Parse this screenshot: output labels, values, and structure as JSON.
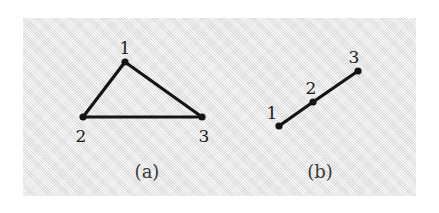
{
  "figure": {
    "background_color": "#ffffff",
    "plate_color": "#e9e9e9",
    "ink_color": "#141414",
    "subfigures": [
      {
        "id": "a",
        "caption": "(a)",
        "caption_x": 147,
        "caption_y": 163,
        "kind": "triangle-graph",
        "nodes": [
          {
            "label": "1",
            "x": 125,
            "y": 62,
            "label_x": 125,
            "label_y": 40
          },
          {
            "label": "2",
            "x": 83,
            "y": 117,
            "label_x": 81,
            "label_y": 128
          },
          {
            "label": "3",
            "x": 202,
            "y": 117,
            "label_x": 204,
            "label_y": 128
          }
        ],
        "edges": [
          {
            "from": 0,
            "to": 1
          },
          {
            "from": 0,
            "to": 2
          },
          {
            "from": 1,
            "to": 2
          }
        ]
      },
      {
        "id": "b",
        "caption": "(b)",
        "caption_x": 320,
        "caption_y": 163,
        "kind": "path-graph",
        "nodes": [
          {
            "label": "1",
            "x": 279,
            "y": 126,
            "label_x": 272,
            "label_y": 105
          },
          {
            "label": "2",
            "x": 313,
            "y": 102,
            "label_x": 311,
            "label_y": 80
          },
          {
            "label": "3",
            "x": 358,
            "y": 71,
            "label_x": 354,
            "label_y": 49
          }
        ],
        "edges": [
          {
            "from": 0,
            "to": 1
          },
          {
            "from": 1,
            "to": 2
          }
        ]
      }
    ],
    "style": {
      "edge_width": 3.2,
      "node_radius": 3.6
    }
  }
}
